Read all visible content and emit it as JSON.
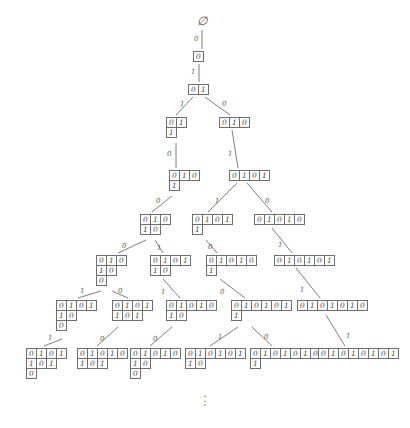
{
  "diagram": {
    "root_symbol": "∅",
    "continuation_dots": "⋮",
    "digits": {
      "zero": "0",
      "one": "1"
    },
    "stroke_color": "#6e6e6e",
    "text_color": "#4a4a4a",
    "background": "#ffffff",
    "nodes": [
      {
        "id": "n0",
        "x": 197,
        "y": 14,
        "type": "root",
        "rows": [],
        "label": "∅"
      },
      {
        "id": "n1",
        "x": 193,
        "y": 51,
        "type": "word",
        "rows": [
          [
            "0"
          ]
        ]
      },
      {
        "id": "n2",
        "x": 188,
        "y": 84,
        "type": "word",
        "rows": [
          [
            "0",
            "1"
          ]
        ]
      },
      {
        "id": "n3",
        "x": 166,
        "y": 117,
        "type": "word",
        "rows": [
          [
            "0",
            "1"
          ],
          [
            "1"
          ]
        ]
      },
      {
        "id": "n4",
        "x": 219,
        "y": 117,
        "type": "word",
        "rows": [
          [
            "0",
            "1",
            "0"
          ]
        ]
      },
      {
        "id": "n5",
        "x": 169,
        "y": 170,
        "type": "word",
        "rows": [
          [
            "0",
            "1",
            "0"
          ],
          [
            "1"
          ]
        ]
      },
      {
        "id": "n6",
        "x": 229,
        "y": 170,
        "type": "word",
        "rows": [
          [
            "0",
            "1",
            "0",
            "1"
          ]
        ]
      },
      {
        "id": "n7",
        "x": 140,
        "y": 214,
        "type": "word",
        "rows": [
          [
            "0",
            "1",
            "0"
          ],
          [
            "1",
            "0"
          ]
        ]
      },
      {
        "id": "n8",
        "x": 192,
        "y": 214,
        "type": "word",
        "rows": [
          [
            "0",
            "1",
            "0",
            "1"
          ],
          [
            "1"
          ]
        ]
      },
      {
        "id": "n9",
        "x": 254,
        "y": 214,
        "type": "word",
        "rows": [
          [
            "0",
            "1",
            "0",
            "1",
            "0"
          ]
        ]
      },
      {
        "id": "n10",
        "x": 96,
        "y": 255,
        "type": "word",
        "rows": [
          [
            "0",
            "1",
            "0"
          ],
          [
            "1",
            "0"
          ],
          [
            "0"
          ]
        ]
      },
      {
        "id": "n11",
        "x": 150,
        "y": 255,
        "type": "word",
        "rows": [
          [
            "0",
            "1",
            "0",
            "1"
          ],
          [
            "1",
            "0"
          ]
        ]
      },
      {
        "id": "n12",
        "x": 206,
        "y": 255,
        "type": "word",
        "rows": [
          [
            "0",
            "1",
            "0",
            "1",
            "0"
          ],
          [
            "1"
          ]
        ]
      },
      {
        "id": "n13",
        "x": 274,
        "y": 255,
        "type": "word",
        "rows": [
          [
            "0",
            "1",
            "0",
            "1",
            "0",
            "1"
          ]
        ]
      },
      {
        "id": "n14",
        "x": 56,
        "y": 300,
        "type": "word",
        "rows": [
          [
            "0",
            "1",
            "0",
            "1"
          ],
          [
            "1",
            "0"
          ],
          [
            "0"
          ]
        ]
      },
      {
        "id": "n15",
        "x": 112,
        "y": 300,
        "type": "word",
        "rows": [
          [
            "0",
            "1",
            "0",
            "1"
          ],
          [
            "1",
            "0",
            "1"
          ]
        ]
      },
      {
        "id": "n16",
        "x": 166,
        "y": 300,
        "type": "word",
        "rows": [
          [
            "0",
            "1",
            "0",
            "1",
            "0"
          ],
          [
            "1",
            "0"
          ]
        ]
      },
      {
        "id": "n17",
        "x": 231,
        "y": 300,
        "type": "word",
        "rows": [
          [
            "0",
            "1",
            "0",
            "1",
            "0",
            "1"
          ],
          [
            "1"
          ]
        ]
      },
      {
        "id": "n18",
        "x": 297,
        "y": 300,
        "type": "word",
        "rows": [
          [
            "0",
            "1",
            "0",
            "1",
            "0",
            "1",
            "0"
          ]
        ]
      },
      {
        "id": "n19",
        "x": 26,
        "y": 348,
        "type": "word",
        "rows": [
          [
            "0",
            "1",
            "0",
            "1"
          ],
          [
            "1",
            "0",
            "1"
          ],
          [
            "0"
          ]
        ]
      },
      {
        "id": "n20",
        "x": 77,
        "y": 348,
        "type": "word",
        "rows": [
          [
            "0",
            "1",
            "0",
            "1",
            "0"
          ],
          [
            "1",
            "0",
            "1"
          ]
        ]
      },
      {
        "id": "n21",
        "x": 130,
        "y": 348,
        "type": "word",
        "rows": [
          [
            "0",
            "1",
            "0",
            "1",
            "0"
          ],
          [
            "1",
            "0"
          ],
          [
            "0"
          ]
        ]
      },
      {
        "id": "n22",
        "x": 185,
        "y": 348,
        "type": "word",
        "rows": [
          [
            "0",
            "1",
            "0",
            "1",
            "0",
            "1"
          ],
          [
            "1",
            "0"
          ]
        ]
      },
      {
        "id": "n23",
        "x": 250,
        "y": 348,
        "type": "word",
        "rows": [
          [
            "0",
            "1",
            "0",
            "1",
            "0",
            "1",
            "0"
          ],
          [
            "1"
          ]
        ]
      },
      {
        "id": "n24",
        "x": 318,
        "y": 348,
        "type": "word",
        "rows": [
          [
            "0",
            "1",
            "0",
            "1",
            "0",
            "1",
            "0",
            "1"
          ]
        ]
      }
    ],
    "edges": [
      {
        "from": "n0",
        "to": "n1",
        "label": "0",
        "x1": 202,
        "y1": 30,
        "x2": 202,
        "y2": 49,
        "lx": 194,
        "ly": 35
      },
      {
        "from": "n1",
        "to": "n2",
        "label": "1",
        "x1": 199,
        "y1": 64,
        "x2": 199,
        "y2": 82,
        "lx": 191,
        "ly": 68
      },
      {
        "from": "n2",
        "to": "n3",
        "label": "1",
        "x1": 193,
        "y1": 97,
        "x2": 176,
        "y2": 115,
        "lx": 180,
        "ly": 100
      },
      {
        "from": "n2",
        "to": "n4",
        "label": "0",
        "x1": 205,
        "y1": 97,
        "x2": 230,
        "y2": 115,
        "lx": 222,
        "ly": 100
      },
      {
        "from": "n3",
        "to": "n5",
        "label": "0",
        "x1": 176,
        "y1": 143,
        "x2": 176,
        "y2": 168,
        "lx": 167,
        "ly": 150
      },
      {
        "from": "n4",
        "to": "n6",
        "label": "1",
        "x1": 232,
        "y1": 130,
        "x2": 238,
        "y2": 168,
        "lx": 228,
        "ly": 150
      },
      {
        "from": "n5",
        "to": "n7",
        "label": "0",
        "x1": 172,
        "y1": 196,
        "x2": 152,
        "y2": 212,
        "lx": 156,
        "ly": 197
      },
      {
        "from": "n6",
        "to": "n8",
        "label": "1",
        "x1": 237,
        "y1": 183,
        "x2": 208,
        "y2": 212,
        "lx": 215,
        "ly": 197
      },
      {
        "from": "n6",
        "to": "n9",
        "label": "0",
        "x1": 247,
        "y1": 183,
        "x2": 272,
        "y2": 212,
        "lx": 265,
        "ly": 197
      },
      {
        "from": "n7",
        "to": "n10",
        "label": "0",
        "x1": 146,
        "y1": 240,
        "x2": 118,
        "y2": 253,
        "lx": 122,
        "ly": 242
      },
      {
        "from": "n7",
        "to": "n11",
        "label": "1",
        "x1": 155,
        "y1": 240,
        "x2": 163,
        "y2": 253,
        "lx": 157,
        "ly": 244
      },
      {
        "from": "n8",
        "to": "n12",
        "label": "0",
        "x1": 206,
        "y1": 240,
        "x2": 217,
        "y2": 253,
        "lx": 208,
        "ly": 243
      },
      {
        "from": "n9",
        "to": "n13",
        "label": "1",
        "x1": 272,
        "y1": 228,
        "x2": 292,
        "y2": 253,
        "lx": 278,
        "ly": 241
      },
      {
        "from": "n10",
        "to": "n14",
        "label": "1",
        "x1": 101,
        "y1": 291,
        "x2": 78,
        "y2": 298,
        "lx": 80,
        "ly": 287
      },
      {
        "from": "n10",
        "to": "n15",
        "label": "0",
        "x1": 112,
        "y1": 291,
        "x2": 128,
        "y2": 298,
        "lx": 118,
        "ly": 287
      },
      {
        "from": "n11",
        "to": "n16",
        "label": "1",
        "x1": 163,
        "y1": 279,
        "x2": 180,
        "y2": 298,
        "lx": 161,
        "ly": 288
      },
      {
        "from": "n12",
        "to": "n17",
        "label": "0",
        "x1": 220,
        "y1": 279,
        "x2": 245,
        "y2": 298,
        "lx": 220,
        "ly": 288
      },
      {
        "from": "n13",
        "to": "n18",
        "label": "1",
        "x1": 296,
        "y1": 268,
        "x2": 320,
        "y2": 298,
        "lx": 300,
        "ly": 286
      },
      {
        "from": "n14",
        "to": "n19",
        "label": "1",
        "x1": 62,
        "y1": 339,
        "x2": 44,
        "y2": 346,
        "lx": 48,
        "ly": 334
      },
      {
        "from": "n15",
        "to": "n20",
        "label": "0",
        "x1": 118,
        "y1": 327,
        "x2": 97,
        "y2": 346,
        "lx": 100,
        "ly": 335
      },
      {
        "from": "n16",
        "to": "n21",
        "label": "0",
        "x1": 172,
        "y1": 327,
        "x2": 150,
        "y2": 346,
        "lx": 153,
        "ly": 335
      },
      {
        "from": "n17",
        "to": "n22",
        "label": "1",
        "x1": 238,
        "y1": 327,
        "x2": 210,
        "y2": 346,
        "lx": 218,
        "ly": 333
      },
      {
        "from": "n17",
        "to": "n23",
        "label": "0",
        "x1": 252,
        "y1": 327,
        "x2": 272,
        "y2": 346,
        "lx": 264,
        "ly": 333
      },
      {
        "from": "n18",
        "to": "n24",
        "label": "1",
        "x1": 326,
        "y1": 315,
        "x2": 345,
        "y2": 346,
        "lx": 346,
        "ly": 332
      }
    ]
  }
}
